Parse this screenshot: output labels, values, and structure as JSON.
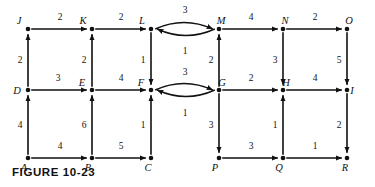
{
  "figure": {
    "caption": "FIGURE 10-23",
    "type": "directed-weighted-graph"
  },
  "chart_data": {
    "type": "diagram",
    "title": "FIGURE 10-23",
    "nodes": [
      {
        "id": "J",
        "label": "J",
        "x": 28,
        "y": 29,
        "label_dx": -9,
        "label_dy": -5
      },
      {
        "id": "K",
        "label": "K",
        "x": 92,
        "y": 29,
        "label_dx": -9,
        "label_dy": -5
      },
      {
        "id": "L",
        "label": "L",
        "x": 151,
        "y": 29,
        "label_dx": -9,
        "label_dy": -5
      },
      {
        "id": "M",
        "label": "M",
        "x": 219,
        "y": 29,
        "label_dx": 2,
        "label_dy": -5
      },
      {
        "id": "N",
        "label": "N",
        "x": 283,
        "y": 29,
        "label_dx": 2,
        "label_dy": -5
      },
      {
        "id": "O",
        "label": "O",
        "x": 347,
        "y": 29,
        "label_dx": 2,
        "label_dy": -5
      },
      {
        "id": "D",
        "label": "D",
        "x": 28,
        "y": 90,
        "label_dx": -11,
        "label_dy": 4
      },
      {
        "id": "E",
        "label": "E",
        "x": 92,
        "y": 90,
        "label_dx": -10,
        "label_dy": -4
      },
      {
        "id": "F",
        "label": "F",
        "x": 151,
        "y": 90,
        "label_dx": -10,
        "label_dy": -4
      },
      {
        "id": "G",
        "label": "G",
        "x": 219,
        "y": 90,
        "label_dx": 3,
        "label_dy": -4
      },
      {
        "id": "H",
        "label": "H",
        "x": 283,
        "y": 90,
        "label_dx": 3,
        "label_dy": -4
      },
      {
        "id": "I",
        "label": "I",
        "x": 347,
        "y": 90,
        "label_dx": 5,
        "label_dy": 4
      },
      {
        "id": "A",
        "label": "A",
        "x": 28,
        "y": 158,
        "label_dx": -4,
        "label_dy": 13
      },
      {
        "id": "B",
        "label": "B",
        "x": 92,
        "y": 158,
        "label_dx": -4,
        "label_dy": 13
      },
      {
        "id": "C",
        "label": "C",
        "x": 151,
        "y": 158,
        "label_dx": -3,
        "label_dy": 13
      },
      {
        "id": "P",
        "label": "P",
        "x": 219,
        "y": 158,
        "label_dx": -4,
        "label_dy": 13
      },
      {
        "id": "Q",
        "label": "Q",
        "x": 283,
        "y": 158,
        "label_dx": -4,
        "label_dy": 13
      },
      {
        "id": "R",
        "label": "R",
        "x": 347,
        "y": 158,
        "label_dx": -2,
        "label_dy": 13
      }
    ],
    "edges": [
      {
        "from": "J",
        "to": "K",
        "weight": "2",
        "kind": "straight",
        "wx": 60,
        "wy": 20
      },
      {
        "from": "K",
        "to": "L",
        "weight": "2",
        "kind": "straight",
        "wx": 121,
        "wy": 20
      },
      {
        "from": "L",
        "to": "M",
        "weight": "3",
        "kind": "curve-up",
        "wx": 185,
        "wy": 13
      },
      {
        "from": "M",
        "to": "L",
        "weight": "1",
        "kind": "curve-down",
        "wx": 185,
        "wy": 54
      },
      {
        "from": "M",
        "to": "N",
        "weight": "4",
        "kind": "straight",
        "wx": 251,
        "wy": 20
      },
      {
        "from": "N",
        "to": "O",
        "weight": "2",
        "kind": "straight",
        "wx": 315,
        "wy": 20
      },
      {
        "from": "D",
        "to": "E",
        "weight": "3",
        "kind": "straight",
        "wx": 58,
        "wy": 81
      },
      {
        "from": "E",
        "to": "F",
        "weight": "4",
        "kind": "straight",
        "wx": 121,
        "wy": 81
      },
      {
        "from": "F",
        "to": "G",
        "weight": "3",
        "kind": "curve-up",
        "wx": 185,
        "wy": 75
      },
      {
        "from": "G",
        "to": "F",
        "weight": "1",
        "kind": "curve-down",
        "wx": 185,
        "wy": 116
      },
      {
        "from": "G",
        "to": "H",
        "weight": "2",
        "kind": "straight",
        "wx": 251,
        "wy": 81
      },
      {
        "from": "H",
        "to": "I",
        "weight": "4",
        "kind": "straight",
        "wx": 315,
        "wy": 81
      },
      {
        "from": "A",
        "to": "B",
        "weight": "4",
        "kind": "straight",
        "wx": 60,
        "wy": 149
      },
      {
        "from": "B",
        "to": "C",
        "weight": "5",
        "kind": "straight",
        "wx": 121,
        "wy": 149
      },
      {
        "from": "P",
        "to": "Q",
        "weight": "3",
        "kind": "straight",
        "wx": 251,
        "wy": 149
      },
      {
        "from": "Q",
        "to": "R",
        "weight": "1",
        "kind": "straight",
        "wx": 315,
        "wy": 149
      },
      {
        "from": "D",
        "to": "J",
        "weight": "2",
        "kind": "straight",
        "wx": 20,
        "wy": 63
      },
      {
        "from": "A",
        "to": "D",
        "weight": "4",
        "kind": "straight",
        "wx": 20,
        "wy": 128
      },
      {
        "from": "E",
        "to": "K",
        "weight": "2",
        "kind": "straight",
        "wx": 84,
        "wy": 63
      },
      {
        "from": "B",
        "to": "E",
        "weight": "6",
        "kind": "straight",
        "wx": 84,
        "wy": 128
      },
      {
        "from": "L",
        "to": "F",
        "weight": "1",
        "kind": "straight",
        "wx": 143,
        "wy": 63
      },
      {
        "from": "C",
        "to": "F",
        "weight": "1",
        "kind": "straight",
        "wx": 143,
        "wy": 128
      },
      {
        "from": "G",
        "to": "M",
        "weight": "2",
        "kind": "straight",
        "wx": 211,
        "wy": 63
      },
      {
        "from": "G",
        "to": "P",
        "weight": "3",
        "kind": "straight",
        "wx": 211,
        "wy": 128
      },
      {
        "from": "N",
        "to": "H",
        "weight": "3",
        "kind": "straight",
        "wx": 275,
        "wy": 63
      },
      {
        "from": "Q",
        "to": "H",
        "weight": "1",
        "kind": "straight",
        "wx": 275,
        "wy": 128
      },
      {
        "from": "O",
        "to": "I",
        "weight": "5",
        "kind": "straight",
        "wx": 339,
        "wy": 63
      },
      {
        "from": "I",
        "to": "R",
        "weight": "2",
        "kind": "straight",
        "wx": 339,
        "wy": 128
      }
    ]
  }
}
